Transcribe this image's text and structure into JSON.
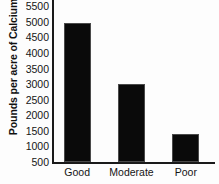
{
  "chart_data": {
    "type": "bar",
    "title": "",
    "xlabel": "",
    "ylabel": "Pounds per acre of Calcium",
    "categories": [
      "Good",
      "Moderate",
      "Poor"
    ],
    "values": [
      4950,
      3000,
      1400
    ],
    "ylim": [
      500,
      5700
    ],
    "yticks": [
      500,
      1000,
      1500,
      2000,
      2500,
      3000,
      3500,
      4000,
      4500,
      5000,
      5500
    ],
    "ytick_labels": [
      "500",
      "1000",
      "1500",
      "2000",
      "2500",
      "3000",
      "3500",
      "4000",
      "4500",
      "5000",
      "5500"
    ],
    "grid": false,
    "legend": false,
    "bar_color": "#0a0a0a",
    "axis_color": "#1a1a1a",
    "background": "#fdfdfd"
  }
}
